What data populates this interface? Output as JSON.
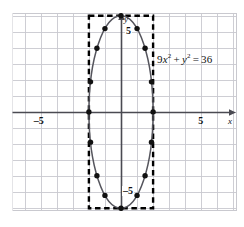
{
  "figure": {
    "type": "graph",
    "background": "#ffffff",
    "grid_color": "#c9c9cf",
    "axis_color": "#4a4a52",
    "curve_color": "#55555d",
    "point_color": "#111111",
    "box_color": "#000000"
  },
  "equation": {
    "coef": "9",
    "x_var": "x",
    "x_exp": "2",
    "plus": "+",
    "y_var": "y",
    "y_exp": "2",
    "equals": "=",
    "rhs": "36",
    "full_text": "9x² + y² = 36"
  },
  "axes": {
    "x_axis_label": "x",
    "y_axis_label": "y",
    "x_tick_negative": "–5",
    "x_tick_positive": "5",
    "y_tick_positive": "5",
    "y_tick_negative": "–5"
  },
  "chart_data": {
    "type": "scatter",
    "title": "",
    "subtitle": "",
    "xlabel": "x",
    "ylabel": "y",
    "annotations": [
      "9x² + y² = 36"
    ],
    "grid": true,
    "legend": "none",
    "xlim": [
      -6.8,
      7.25
    ],
    "ylim": [
      -6.2,
      6.2
    ],
    "x_ticks": [
      -5,
      5
    ],
    "y_ticks": [
      -5,
      5
    ],
    "x_tick_labels": [
      "–5",
      "5"
    ],
    "y_tick_labels": [
      "–5",
      "5"
    ],
    "grid_step": 1,
    "curve": {
      "name": "ellipse 9x² + y² = 36",
      "form": "x^2/4 + y^2/36 = 1",
      "center": [
        0,
        0
      ],
      "semi_axis_x": 2,
      "semi_axis_y": 6,
      "vertices": [
        [
          0,
          6
        ],
        [
          0,
          -6
        ]
      ],
      "co_vertices": [
        [
          -2,
          0
        ],
        [
          2,
          0
        ]
      ]
    },
    "bounding_box": {
      "style": "dashed",
      "x_range": [
        -2,
        2
      ],
      "y_range": [
        -6,
        6
      ]
    },
    "marked_points": [
      [
        0,
        6
      ],
      [
        1,
        5.196
      ],
      [
        -1,
        5.196
      ],
      [
        1.5,
        3.969
      ],
      [
        -1.5,
        3.969
      ],
      [
        1.9,
        1.879
      ],
      [
        -1.9,
        1.879
      ],
      [
        2,
        0
      ],
      [
        -2,
        0
      ],
      [
        1.9,
        -1.879
      ],
      [
        -1.9,
        -1.879
      ],
      [
        1.5,
        -3.969
      ],
      [
        -1.5,
        -3.969
      ],
      [
        1,
        -5.196
      ],
      [
        -1,
        -5.196
      ],
      [
        0,
        -6
      ]
    ]
  }
}
